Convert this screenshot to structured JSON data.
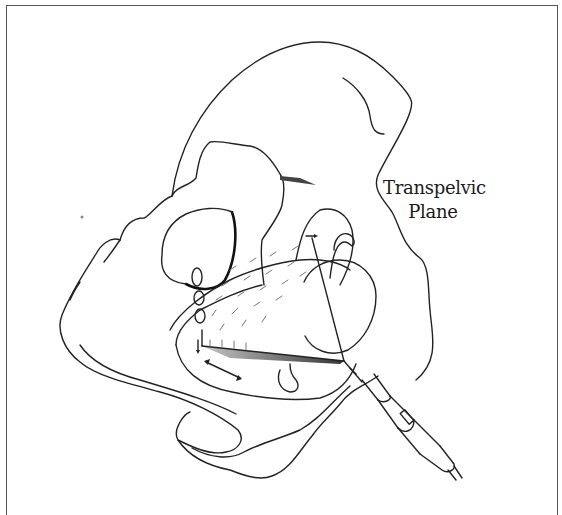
{
  "figure": {
    "label_line1": "Transpelvic",
    "label_line2": "Plane",
    "instrument": "ultrasound-transducer-probe",
    "colors": {
      "line": "#222222",
      "background": "#ffffff",
      "frame": "#555555",
      "hatch": "#777777"
    }
  }
}
